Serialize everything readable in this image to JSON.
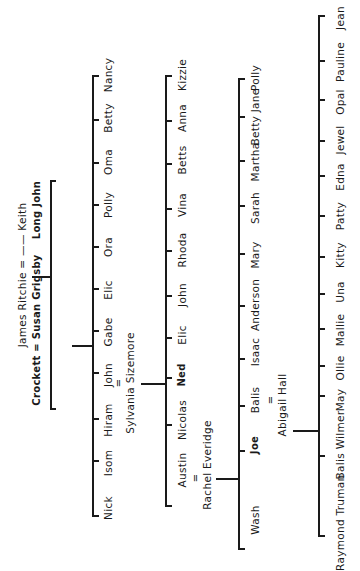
{
  "diagram": {
    "type": "family-tree",
    "orientation": "rotated-90-ccw",
    "line_color": "#1a1a1a",
    "background": "#ffffff",
    "generation_0": {
      "couple": "James Ritchie = —— Keith"
    },
    "generation_1": {
      "children": [
        {
          "name": "Long John"
        },
        {
          "name": "Crockett",
          "spouse_label": "Crockett = Susan Grigsby"
        }
      ]
    },
    "generation_2": {
      "parents": "Crockett = Susan Grigsby",
      "children": [
        "Nancy",
        "Betty",
        "Oma",
        "Polly",
        "Ora",
        "Elic",
        "Gabe",
        "John",
        "Hiram",
        "Isom",
        "Nick"
      ],
      "married": {
        "name": "John",
        "equals": "=",
        "spouse": "Sylvania Sizemore"
      }
    },
    "generation_3": {
      "parents": "John = Sylvania Sizemore",
      "children": [
        "Kizzie",
        "Anna",
        "Betts",
        "Vina",
        "Rhoda",
        "John",
        "Elic",
        "Ned",
        "Nicolas",
        "Austin"
      ],
      "married": {
        "name": "Austin",
        "equals": "=",
        "spouse": "Rachel Everidge"
      }
    },
    "generation_4": {
      "parents": "Austin = Rachel Everidge",
      "children": [
        "Polly",
        "Betty Jane",
        "Martha",
        "Sarah",
        "Mary",
        "Anderson",
        "Isaac",
        "Balis",
        "Joe",
        "Wash"
      ],
      "married": {
        "name": "Balis",
        "equals": "=",
        "spouse": "Abigail Hall"
      }
    },
    "generation_5": {
      "parents": "Balis = Abigail Hall",
      "children": [
        "Jean",
        "Pauline",
        "Opal",
        "Jewel",
        "Edna",
        "Patty",
        "Kitty",
        "Una",
        "Mallie",
        "Ollie",
        "May",
        "Balis Wilmer",
        "Truman",
        "Raymond"
      ]
    }
  }
}
